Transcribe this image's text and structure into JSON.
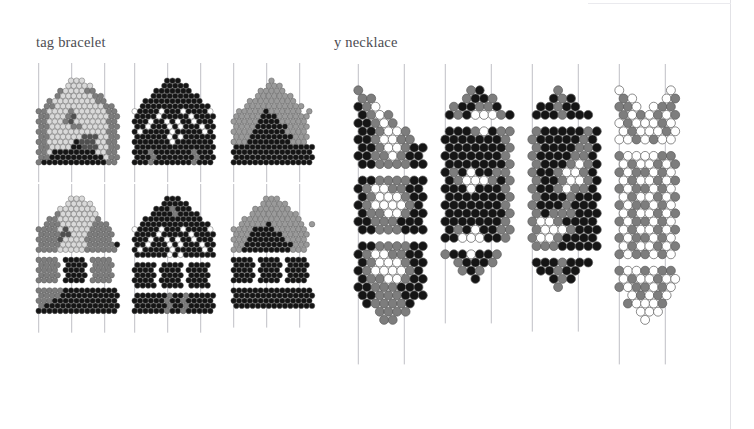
{
  "document": {
    "background_color": "#ffffff",
    "page_border_color": "#e2e2e6",
    "guide_line_color": "#b9b9bf",
    "bead_outline_color": "#5a5a5a",
    "title_color": "#4c4c52"
  },
  "sections": [
    {
      "id": "tag-bracelet",
      "label": "tag bracelet",
      "x": 36,
      "y": 34
    },
    {
      "id": "y-necklace",
      "label": "y necklace",
      "x": 334,
      "y": 34
    }
  ],
  "palette": {
    "white": "#ffffff",
    "pale": "#d9d9d9",
    "light": "#c2c2c2",
    "mid": "#9a9a9a",
    "midgray": "#7d7d7d",
    "dark": "#4f4f4f",
    "black": "#151515"
  },
  "legend": [
    {
      "key": "white",
      "color": "#ffffff",
      "name": "white bead"
    },
    {
      "key": "pale",
      "color": "#d9d9d9",
      "name": "pale gray bead"
    },
    {
      "key": "light",
      "color": "#c2c2c2",
      "name": "light gray bead"
    },
    {
      "key": "mid",
      "color": "#9a9a9a",
      "name": "medium gray bead"
    },
    {
      "key": "midgray",
      "color": "#7d7d7d",
      "name": "dark medium gray bead"
    },
    {
      "key": "dark",
      "color": "#4f4f4f",
      "name": "dark gray bead"
    },
    {
      "key": "black",
      "color": "#151515",
      "name": "black bead"
    }
  ],
  "chart_data": {
    "type": "heatmap",
    "xlabel": "",
    "ylabel": "",
    "panels": [
      {
        "id": "tag-1",
        "section": "tag bracelet",
        "x": 36,
        "y": 78,
        "bead": 5.4,
        "row_step": 5.1,
        "offset_stagger": true,
        "guides": [
          0,
          33,
          66
        ],
        "guide_top": -15,
        "guide_bottom": 12,
        "grid": [
          "......ppp......",
          ".....ppppp.....",
          "....mppppmm....",
          "...mppppppmm...",
          "..mppppppppmm..",
          ".mmpppppppppmm.",
          "mmppppmppppppmm",
          "mmpppmdppppppmm",
          "mmpppmdppppppmm",
          "mmppppmmpppppmm",
          "mmpppppppppppmm",
          "mmppppppdddppmm",
          "mmpppppkdddppmm",
          "mmppppkkdddppmm",
          "mmpkkkkkkkkppmm",
          "mmkkkkkkkkkkpmm",
          "mkkkkkkkkkkkkmm"
        ]
      },
      {
        "id": "tag-2",
        "section": "tag bracelet",
        "x": 132,
        "y": 78,
        "bead": 5.4,
        "row_step": 5.1,
        "offset_stagger": true,
        "guides": [
          0,
          33,
          66
        ],
        "guide_top": -15,
        "guide_bottom": 12,
        "grid": [
          "......kkk......",
          ".....kkkkk.....",
          "....kkkkkkk....",
          "...kkkkkkkkk...",
          "..kkkkkkkkkkk..",
          ".kkkkkkkkkkkkk.",
          "wkkkkwkkkwkkkkw",
          "kkkkwkkkkkwkkkk",
          "kkkwkkwkwkkwkkk",
          "kkwkkkwkwkkkwkk",
          "kwkkkkkwkkkkkwk",
          "kkkkkkwkwkkkkkk",
          "kkkkkkkwkkkkkkk",
          "kkkkkkkkkkkkkkk",
          "kkkmkkkkkkkmkkk",
          "kkkmkkkkkkkmkkk",
          "kkkmkkkkkkkmkkk"
        ]
      },
      {
        "id": "tag-3",
        "section": "tag bracelet",
        "x": 231,
        "y": 78,
        "bead": 5.4,
        "row_step": 5.1,
        "offset_stagger": true,
        "guides": [
          0,
          33,
          66
        ],
        "guide_top": -15,
        "guide_bottom": 12,
        "grid": [
          ".......g.......",
          "......ggg......",
          ".....ggggg.....",
          "....ggggggg....",
          "...ggggggggg...",
          "..ggggggggggg..",
          ".gggggkgggggg g",
          "gggggkkkgggggg.",
          "gggggkkkkggggg.",
          "ggggkkkkkkgggg.",
          "ggggkkkkkkgggg.",
          "gggkkkkkkkkggg.",
          "gggkkkkkkkkggg.",
          "kkkkkkkkkkkkkkk",
          "kkkkkkkkkkkkkkk",
          "kkkkkkkkkkkkkkk",
          "kkkkkkkkkkkkkkk"
        ]
      },
      {
        "id": "tag-4",
        "section": "tag bracelet",
        "x": 36,
        "y": 196,
        "bead": 5.4,
        "row_step": 5.1,
        "offset_stagger": true,
        "guides": [
          0,
          33,
          66
        ],
        "guide_top": -12,
        "guide_bottom": 14,
        "grid": [
          "......ppp......",
          ".....ppppp.....",
          "....ppppppp....",
          "...mppppppp....",
          "..mmpppppppm...",
          ".mmmppppppmmm..",
          "mmmmpdppppmmmm.",
          "mmmmddpppmmmmm.",
          "mmmmdppppmmmmm.",
          "mmmmpppppmmmmmk",
          "mmmmpppppmmmmmm",
          "...............",
          "mmmm.kkkk.mmmm.",
          "mmmm.kkkk.mmmm.",
          "mmmm.kkkk.mmmm.",
          "mmmm.kkkk.mmmm.",
          "mmmm.kkkk.mmmm.",
          "...............",
          "mmmmmkkkkkkkkkk",
          "mmmmkkkkkkkkkkk",
          "mmmkkkkkkkkkkkk",
          "mkkkkkkkkkkkkkk",
          "kkkkkkkkkkkkkkk"
        ]
      },
      {
        "id": "tag-5",
        "section": "tag bracelet",
        "x": 132,
        "y": 196,
        "bead": 5.4,
        "row_step": 5.1,
        "offset_stagger": true,
        "guides": [
          0,
          33,
          66
        ],
        "guide_top": -12,
        "guide_bottom": 14,
        "grid": [
          "......kkk......",
          ".....kkkkk.....",
          "....kkkmkkk....",
          "...kkkkmkkkk...",
          "..kkkkkkkkkkk..",
          ".kkkkkkkkkkkkk.",
          "wkkkkwkkkwkkkkw",
          "kkkkwkkkkkwkkkk",
          "kkkwkkwkwkkwkkk",
          "kkwkkkwkwkkkwkk",
          "kwkkkkkwkkkkkwk",
          "kkkkkkwkwkkkkkk",
          "...............",
          "kkkk.kkkk.kkkk.",
          "kkkk.kkkk.kkkk.",
          "kkkk.kkkk.kkkk.",
          "kkkk.kkkk.kkkk.",
          "kkkk.kkkk.kkkk.",
          "...............",
          "kkkkkkmkkmkkkkk",
          "kkkkkkmkkmkkkkk",
          "kkkkkkmkkmkkkkk",
          "kkkkkkmkkmkkkkk"
        ]
      },
      {
        "id": "tag-6",
        "section": "tag bracelet",
        "x": 231,
        "y": 196,
        "bead": 5.4,
        "row_step": 5.1,
        "offset_stagger": true,
        "guides": [
          0,
          33,
          66
        ],
        "guide_top": -12,
        "guide_bottom": 14,
        "grid": [
          "......ggg......",
          ".....ggggg.....",
          "....ggggggg....",
          "...ggggggggg...",
          "..ggggggggggg..",
          ".gggggkgggggg.g",
          "ggggkkkkgggggg.",
          "gggkkkkkkggggg.",
          "gggkkkkkkkgggg.",
          "ggkkkkkkkkkggg.",
          "ggkkkkkkkkkggg.",
          "...............",
          "kkkk.kkkk.kkkk.",
          "kkkk.kkkk.kkkk.",
          "kkkk.kkkk.kkkk.",
          "kkkk.kkkk.kkkk.",
          "kkkk.kkkk.kkkk.",
          "...............",
          "kkkkkkkkkkkkkkk",
          "kkkkkkkkkkkkkkk",
          "kkkkkkkkkkkkkkk",
          "kkkkkkkkkkkkkkk"
        ]
      },
      {
        "id": "necklace-1",
        "section": "y necklace",
        "x": 354,
        "y": 86,
        "bead": 8.6,
        "row_step": 8.2,
        "offset_stagger": true,
        "guides": [
          0,
          46
        ],
        "guide_top": -22,
        "guide_bottom": 32,
        "grid": [
          "m.......",
          "mm......",
          "kmw.....",
          "kmwm....",
          "kkmwm...",
          "kkmwwm..",
          "kkmwwmm.",
          "kkmwwmkk",
          "kkmmwmkk",
          "kkmmmmkk",
          "........",
          "kkmmmmkk",
          "kmwwmmkk",
          "kmwwwmkk",
          "kmwwwwmk",
          "kmmwwmkk",
          "kkmmmkkk",
          "kkmmmkkk",
          "........",
          "kkmmmmkk",
          "kmwwmmkk",
          "kmwwwmkk",
          "kmwwwwmk",
          "kmmwwmkk",
          "kkmmmkkk",
          "kkmmmkkk",
          ".kmmmmk.",
          "..mmmm..",
          "...mm..."
        ]
      },
      {
        "id": "necklace-2",
        "section": "y necklace",
        "x": 441,
        "y": 86,
        "bead": 8.6,
        "row_step": 8.2,
        "offset_stagger": true,
        "guides": [
          0,
          46
        ],
        "guide_top": -22,
        "guide_bottom": 32,
        "grid": [
          "...mk...",
          "..mkkm..",
          ".mkkmmk.",
          "kmkwwwmk",
          "........",
          "kkkmwkmm",
          "kkkkkkkm",
          "kkkkkkkm",
          "kkkkkkkm",
          "kkkkkkkm",
          "kmkwkkmm",
          "kmwwwmkm",
          "kkkwkkkm",
          "kkkkkkkm",
          "kkkkkkkm",
          "kkkkkkkm",
          "kkkkkkkm",
          "kmkwkkmm",
          "kkwwwkkm",
          "........",
          "mkkwkkm.",
          ".mkkkm..",
          "..mkm...",
          "...k...."
        ]
      },
      {
        "id": "necklace-3",
        "section": "y necklace",
        "x": 528,
        "y": 86,
        "bead": 8.6,
        "row_step": 8.2,
        "offset_stagger": true,
        "guides": [
          0,
          46
        ],
        "guide_top": -22,
        "guide_bottom": 32,
        "grid": [
          "...m....",
          "..kmk...",
          ".kkmkk..",
          "kkkmkkk.",
          "........",
          "mkkkkkmk",
          "mkkkkkmk",
          "mkkkkmmk",
          "mkkkkmmk",
          "mkkkmwmk",
          "mkkmwwmk",
          "mkkmwwmk",
          "mkkmwmmk",
          "mkkkmkkk",
          "mkkkmkkk",
          "mkmmmkkk",
          "mwwmkkkk",
          "mwwwmkkk",
          "mwwmkkkk",
          "mmmkkkkk",
          "........",
          "kkkmkkk.",
          ".kkmkk..",
          "..kmk...",
          "...m...."
        ]
      },
      {
        "id": "necklace-4",
        "section": "y necklace",
        "x": 615,
        "y": 86,
        "bead": 8.6,
        "row_step": 8.2,
        "offset_stagger": true,
        "guides": [
          0,
          46
        ],
        "guide_top": -22,
        "guide_bottom": 32,
        "grid": [
          "w.....w.",
          "mw...wm.",
          "mmw.wmm.",
          "mwmwmwm.",
          "wmwwwmw.",
          "wmwwwmw.",
          "wwmwmww.",
          "........",
          "mwwwwmm.",
          "wmwwmwm.",
          "mwmmwmw.",
          "wmwwmwm.",
          "mwmmwmw.",
          "wmwwmwm.",
          "mwmmwmw.",
          "wmwwmwm.",
          "mwmmwmw.",
          "wmwwmwm.",
          "mwmmwmw.",
          "wmwwmwm.",
          "mwmmwmw.",
          "........",
          "mwwmwmm.",
          "wmwwmww.",
          "mwmmwmw.",
          ".wmwmw..",
          ".mwwwm..",
          "..www...",
          "...w...."
        ]
      }
    ]
  }
}
